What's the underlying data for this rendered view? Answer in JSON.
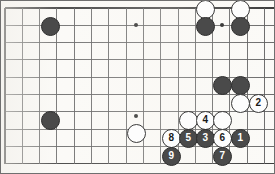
{
  "figure": {
    "kind": "go-board-diagram",
    "title": "",
    "board": {
      "rows": 10,
      "cols": 15,
      "x_origin": 5,
      "y_origin": 8,
      "spacing": 17.3,
      "line_color": "#5c5c5c",
      "edge_color": "#3c3c3c",
      "background": "#fbfaf7",
      "top_edge_visible": true,
      "left_edge_visible": true,
      "bottom_edge_visible": true,
      "right_edge_visible": false
    },
    "star_points": [
      {
        "col": 7.6,
        "row": 1
      },
      {
        "col": 12.55,
        "row": 1
      },
      {
        "col": 7.6,
        "row": 6.25
      }
    ],
    "colors": {
      "black_stone": "#4a4a4a",
      "black_stone_edge": "#2e2e2e",
      "white_stone": "#fdfdfd",
      "white_stone_edge": "#3a3a3a",
      "black_number_text": "#ffffff",
      "white_number_text": "#1a1a1a"
    },
    "stone_radius": 9.5,
    "stones": [
      {
        "name": "black-stone-upper-left",
        "color": "black",
        "label": "",
        "x": 50,
        "y": 26
      },
      {
        "name": "white-stone-top-right-a",
        "color": "white",
        "label": "",
        "x": 205,
        "y": 9
      },
      {
        "name": "white-stone-top-right-b",
        "color": "white",
        "label": "",
        "x": 240,
        "y": 9
      },
      {
        "name": "black-stone-top-right-a",
        "color": "black",
        "label": "",
        "x": 205,
        "y": 26
      },
      {
        "name": "black-stone-top-right-b",
        "color": "black",
        "label": "",
        "x": 240,
        "y": 26
      },
      {
        "name": "black-stone-right-a",
        "color": "black",
        "label": "",
        "x": 222,
        "y": 85
      },
      {
        "name": "black-stone-right-b",
        "color": "black",
        "label": "",
        "x": 240,
        "y": 85
      },
      {
        "name": "white-stone-right-c",
        "color": "white",
        "label": "",
        "x": 240,
        "y": 103
      },
      {
        "name": "move-2-white",
        "color": "white",
        "label": "2",
        "x": 258,
        "y": 103
      },
      {
        "name": "black-stone-left-lower",
        "color": "black",
        "label": "",
        "x": 50,
        "y": 120
      },
      {
        "name": "white-stone-center-lower",
        "color": "white",
        "label": "",
        "x": 136,
        "y": 133
      },
      {
        "name": "white-stone-above-five",
        "color": "white",
        "label": "",
        "x": 188,
        "y": 120
      },
      {
        "name": "move-4-white",
        "color": "white",
        "label": "4",
        "x": 205,
        "y": 120
      },
      {
        "name": "white-stone-above-six",
        "color": "white",
        "label": "",
        "x": 222,
        "y": 120
      },
      {
        "name": "move-8-white",
        "color": "white",
        "label": "8",
        "x": 171,
        "y": 138
      },
      {
        "name": "move-5-black",
        "color": "black",
        "label": "5",
        "x": 188,
        "y": 138
      },
      {
        "name": "move-3-black",
        "color": "black",
        "label": "3",
        "x": 205,
        "y": 138
      },
      {
        "name": "move-6-white",
        "color": "white",
        "label": "6",
        "x": 222,
        "y": 138
      },
      {
        "name": "move-1-black",
        "color": "black",
        "label": "1",
        "x": 240,
        "y": 138
      },
      {
        "name": "move-9-black",
        "color": "black",
        "label": "9",
        "x": 171,
        "y": 156
      },
      {
        "name": "move-7-black",
        "color": "black",
        "label": "7",
        "x": 222,
        "y": 156
      }
    ],
    "move_sequence": [
      "1",
      "2",
      "3",
      "4",
      "5",
      "6",
      "7",
      "8",
      "9"
    ]
  }
}
